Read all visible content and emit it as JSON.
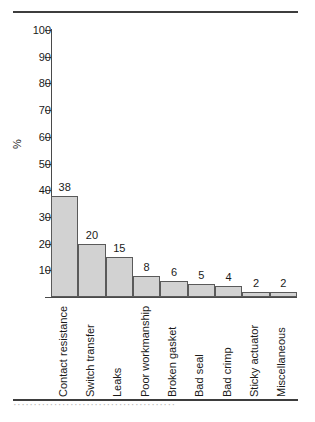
{
  "figure": {
    "top_rule": "",
    "bottom_rule": "",
    "caption_fragment": "········································"
  },
  "colors": {
    "bar_fill": "#d2d2d2",
    "bar_border": "#5a5a5a",
    "axis": "#4a4a4a",
    "rule": "#3d3d3d",
    "text": "#1a1a1a",
    "background": "#ffffff"
  },
  "chart_data": {
    "type": "bar",
    "title": "",
    "xlabel": "",
    "ylabel": "%",
    "ylim": [
      0,
      100
    ],
    "yticks": [
      0,
      10,
      20,
      30,
      40,
      50,
      60,
      70,
      80,
      90,
      100
    ],
    "ytick_labels": [
      "",
      "10",
      "20",
      "30",
      "40",
      "50",
      "60",
      "70",
      "80",
      "90",
      "100"
    ],
    "grid": false,
    "legend": false,
    "orientation": "vertical",
    "categories": [
      "Contact resistance",
      "Switch transfer",
      "Leaks",
      "Poor workmanship",
      "Broken gasket",
      "Bad seal",
      "Bad crimp",
      "Sticky actuator",
      "Miscellaneous"
    ],
    "values": [
      38,
      20,
      15,
      8,
      6,
      5,
      4,
      2,
      2
    ],
    "value_labels": [
      "38",
      "20",
      "15",
      "8",
      "6",
      "5",
      "4",
      "2",
      "2"
    ]
  }
}
